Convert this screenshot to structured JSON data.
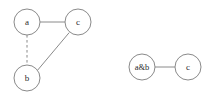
{
  "figure": {
    "title": "",
    "background_color": "#ffffff",
    "stroke_color": "#8a8a8a",
    "label_color": "#2b2b2b",
    "node_radius": 13
  },
  "graphs": [
    {
      "id": "graph-left",
      "name": "original-graph",
      "nodes": [
        {
          "id": "a",
          "label": "a",
          "cx": 27,
          "cy": 22,
          "r": 13
        },
        {
          "id": "c",
          "label": "c",
          "cx": 78,
          "cy": 22,
          "r": 13
        },
        {
          "id": "b",
          "label": "b",
          "cx": 27,
          "cy": 78,
          "r": 13
        }
      ],
      "edges": [
        {
          "id": "a-c",
          "from": "a",
          "to": "c",
          "style": "solid",
          "x1": 40,
          "y1": 22,
          "x2": 65,
          "y2": 22
        },
        {
          "id": "a-b",
          "from": "a",
          "to": "b",
          "style": "dashed",
          "x1": 27,
          "y1": 35,
          "x2": 27,
          "y2": 65
        },
        {
          "id": "b-c",
          "from": "b",
          "to": "c",
          "style": "solid",
          "x1": 37.5,
          "y1": 70.3,
          "x2": 69.2,
          "y2": 32.6
        }
      ]
    },
    {
      "id": "graph-right",
      "name": "contracted-graph",
      "nodes": [
        {
          "id": "ab",
          "label": "a&b",
          "cx": 142,
          "cy": 67,
          "r": 13
        },
        {
          "id": "c2",
          "label": "c",
          "cx": 188,
          "cy": 67,
          "r": 13
        }
      ],
      "edges": [
        {
          "id": "ab-c",
          "from": "ab",
          "to": "c2",
          "style": "solid",
          "x1": 155,
          "y1": 67,
          "x2": 175,
          "y2": 67
        }
      ]
    }
  ]
}
